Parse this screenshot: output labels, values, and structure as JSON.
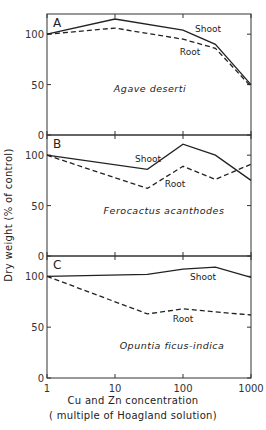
{
  "chart_data": [
    {
      "type": "line",
      "panel_label": "A",
      "species": "Agave deserti",
      "xscale": "log",
      "xlim": [
        1,
        1000
      ],
      "ylim": [
        0,
        120
      ],
      "yticks": [
        0,
        50,
        100
      ],
      "series": [
        {
          "name": "Shoot",
          "style": "solid",
          "x": [
            1,
            10,
            100,
            300,
            1000
          ],
          "values": [
            100,
            115,
            104,
            90,
            50
          ]
        },
        {
          "name": "Root",
          "style": "dashed",
          "x": [
            1,
            10,
            100,
            300,
            1000
          ],
          "values": [
            100,
            106,
            95,
            86,
            48
          ]
        }
      ]
    },
    {
      "type": "line",
      "panel_label": "B",
      "species": "Ferocactus acanthodes",
      "xscale": "log",
      "xlim": [
        1,
        1000
      ],
      "ylim": [
        0,
        120
      ],
      "yticks": [
        0,
        50,
        100
      ],
      "series": [
        {
          "name": "Shoot",
          "style": "solid",
          "x": [
            1,
            30,
            100,
            300,
            1000
          ],
          "values": [
            100,
            86,
            111,
            100,
            75
          ]
        },
        {
          "name": "Root",
          "style": "dashed",
          "x": [
            1,
            30,
            100,
            300,
            1000
          ],
          "values": [
            100,
            67,
            89,
            76,
            91
          ]
        }
      ]
    },
    {
      "type": "line",
      "panel_label": "C",
      "species": "Opuntia ficus-indica",
      "xscale": "log",
      "xlim": [
        1,
        1000
      ],
      "ylim": [
        0,
        120
      ],
      "yticks": [
        0,
        50,
        100
      ],
      "series": [
        {
          "name": "Shoot",
          "style": "solid",
          "x": [
            1,
            30,
            100,
            300,
            1000
          ],
          "values": [
            100,
            102,
            107,
            109,
            99
          ]
        },
        {
          "name": "Root",
          "style": "dashed",
          "x": [
            1,
            30,
            100,
            300,
            1000
          ],
          "values": [
            100,
            63,
            68,
            65,
            62
          ]
        }
      ]
    }
  ],
  "axes": {
    "ylabel": "Dry weight (% of control)",
    "xlabel_line1": "Cu and Zn concentration",
    "xlabel_line2": "( multiple of Hoagland solution)",
    "xticks": [
      1,
      10,
      100,
      1000
    ],
    "xtick_labels": [
      "1",
      "10",
      "100",
      "1000"
    ]
  },
  "labels": {
    "shoot": "Shoot",
    "root": "Root"
  }
}
